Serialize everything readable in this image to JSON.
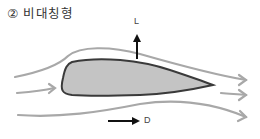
{
  "title": "② 비대칭형",
  "labels": {
    "lift": "L",
    "drag": "D"
  },
  "colors": {
    "airfoil_fill": "#c4c4c4",
    "airfoil_stroke": "#3a3a3a",
    "streamline": "#a8a8a8",
    "arrow": "#111111"
  }
}
